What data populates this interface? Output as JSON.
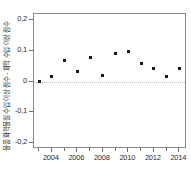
{
  "chart_data": {
    "type": "scatter",
    "title": "",
    "subtitle": "",
    "xlabel": "",
    "ylabel": "물품 화학물질 수입 이상 점수 - 화학 수입 이상 점수",
    "xlim": [
      2002.6,
      2014.6
    ],
    "ylim": [
      -0.22,
      0.22
    ],
    "grid": false,
    "legend": null,
    "legend_position": "none",
    "decimal_separator": ",",
    "y_ticks": [
      0.2,
      0.1,
      0.0,
      -0.1,
      -0.2
    ],
    "y_tick_labels": [
      "0,2",
      "0,1",
      "0",
      "-0,1",
      "-0,2"
    ],
    "x_ticks": [
      2004,
      2006,
      2008,
      2010,
      2012,
      2014
    ],
    "x_tick_labels": [
      "2004",
      "2006",
      "2008",
      "2010",
      "2012",
      "2014"
    ],
    "x_minor_ticks": [
      2003,
      2005,
      2007,
      2009,
      2011,
      2013
    ],
    "reference_line": {
      "y": 0,
      "style": "dotted",
      "color": "#bdbdbd"
    },
    "marker": {
      "shape": "square",
      "size": 3,
      "color": "#1a1a1a"
    },
    "x": [
      2003,
      2004,
      2005,
      2006,
      2007,
      2008,
      2009,
      2010,
      2011,
      2012,
      2013,
      2014
    ],
    "values": [
      0.0,
      0.015,
      0.07,
      0.033,
      0.079,
      0.018,
      0.091,
      0.098,
      0.058,
      0.044,
      0.016,
      0.042
    ],
    "series": [
      {
        "name": "물품 화학물질 수입 이상 점수 차이",
        "points": [
          {
            "x": 2003,
            "y": 0.0
          },
          {
            "x": 2004,
            "y": 0.015
          },
          {
            "x": 2005,
            "y": 0.07
          },
          {
            "x": 2006,
            "y": 0.033
          },
          {
            "x": 2007,
            "y": 0.079
          },
          {
            "x": 2008,
            "y": 0.018
          },
          {
            "x": 2009,
            "y": 0.091
          },
          {
            "x": 2010,
            "y": 0.098
          },
          {
            "x": 2011,
            "y": 0.058
          },
          {
            "x": 2012,
            "y": 0.044
          },
          {
            "x": 2013,
            "y": 0.016
          },
          {
            "x": 2014,
            "y": 0.042
          }
        ]
      }
    ]
  },
  "axis": {
    "y_title": "물품 화학물질 수입 이상 점수 - 화학 수입 이상 점수"
  }
}
